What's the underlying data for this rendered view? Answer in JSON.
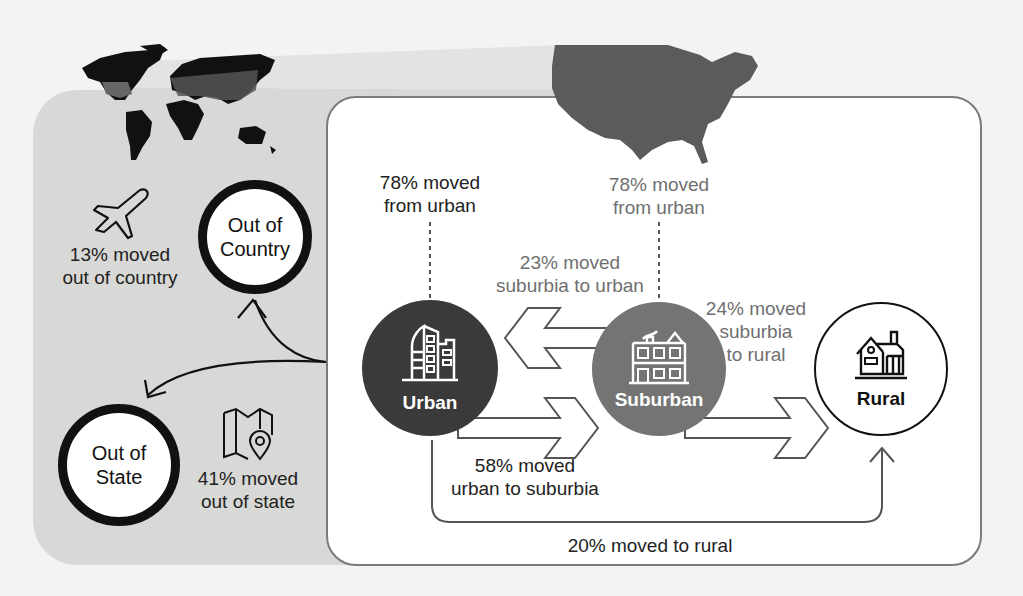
{
  "colors": {
    "background": "#f3f3f1",
    "outer_panel": "#d8d8d6",
    "inner_panel": "#ffffff",
    "urban_node": "#3a3a3a",
    "suburban_node": "#747474",
    "rural_node": "#ffffff",
    "map_land": "#111111",
    "us_map": "#5b5b5b"
  },
  "outer": {
    "out_of_country": {
      "label_line1": "Out of",
      "label_line2": "Country",
      "stat_line1": "13% moved",
      "stat_line2": "out of country",
      "icon": "airplane-icon"
    },
    "out_of_state": {
      "label_line1": "Out of",
      "label_line2": "State",
      "stat_line1": "41% moved",
      "stat_line2": "out of state",
      "icon": "map-pin-icon"
    }
  },
  "inner": {
    "urban_header": {
      "line1": "78% moved",
      "line2": "from urban"
    },
    "suburban_header": {
      "line1": "78% moved",
      "line2": "from urban"
    },
    "nodes": {
      "urban": {
        "label": "Urban",
        "icon": "city-buildings-icon"
      },
      "suburban": {
        "label": "Suburban",
        "icon": "townhouse-icon"
      },
      "rural": {
        "label": "Rural",
        "icon": "farmhouse-icon"
      }
    },
    "flows": {
      "suburbia_to_urban": {
        "line1": "23% moved",
        "line2": "suburbia to urban"
      },
      "suburbia_to_rural": {
        "line1": "24% moved",
        "line2": "suburbia",
        "line3": "to rural"
      },
      "urban_to_suburbia": {
        "line1": "58% moved",
        "line2": "urban to suburbia"
      },
      "to_rural": {
        "line1": "20% moved to rural"
      }
    }
  }
}
